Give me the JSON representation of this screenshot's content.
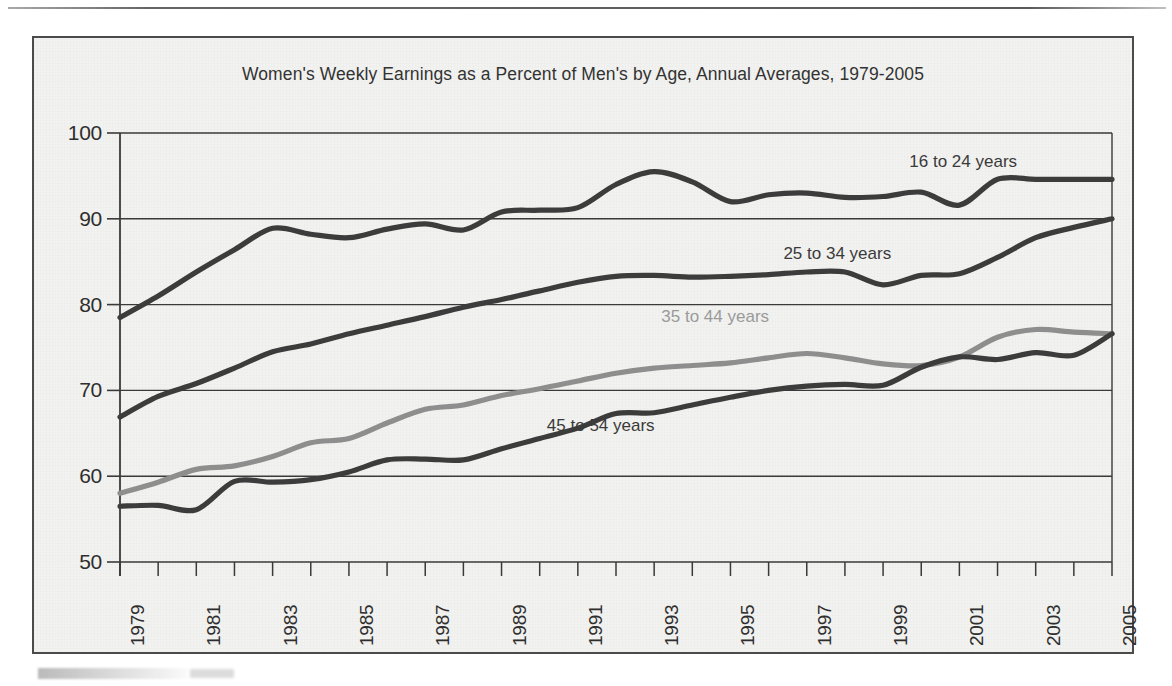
{
  "chart_data": {
    "type": "line",
    "title": "Women's Weekly Earnings as a Percent of Men's by Age, Annual Averages, 1979-2005",
    "xlabel": "",
    "ylabel": "",
    "ylim": [
      50,
      100
    ],
    "xlim": [
      1979,
      2005
    ],
    "yticks": [
      50,
      60,
      70,
      80,
      90,
      100
    ],
    "ytick_labels": [
      "50",
      "60",
      "70",
      "80",
      "90",
      "100"
    ],
    "grid": "horizontal",
    "legend_position": "inline-annotations",
    "x": [
      1979,
      1980,
      1981,
      1982,
      1983,
      1984,
      1985,
      1986,
      1987,
      1988,
      1989,
      1990,
      1991,
      1992,
      1993,
      1994,
      1995,
      1996,
      1997,
      1998,
      1999,
      2000,
      2001,
      2002,
      2003,
      2004,
      2005
    ],
    "xtick_labels": [
      "1979",
      "1981",
      "1983",
      "1985",
      "1987",
      "1989",
      "1991",
      "1993",
      "1995",
      "1997",
      "1999",
      "2001",
      "2003",
      "2005"
    ],
    "xtick_label_years": [
      1979,
      1981,
      1983,
      1985,
      1987,
      1989,
      1991,
      1993,
      1995,
      1997,
      1999,
      2001,
      2003,
      2005
    ],
    "series": [
      {
        "name": "16 to 24 years",
        "color": "#3c3c3c",
        "label_x": 2001.1,
        "label_y": 96.6,
        "values": [
          78.5,
          81.0,
          83.8,
          86.4,
          88.9,
          88.2,
          87.8,
          88.8,
          89.4,
          88.7,
          90.8,
          91.0,
          91.3,
          94.0,
          95.5,
          94.3,
          92.0,
          92.8,
          93.0,
          92.5,
          92.6,
          93.1,
          91.6,
          94.6,
          94.6,
          94.6,
          94.6
        ]
      },
      {
        "name": "25 to 34 years",
        "color": "#3c3c3c",
        "label_x": 1997.8,
        "label_y": 85.9,
        "values": [
          66.9,
          69.3,
          70.8,
          72.6,
          74.5,
          75.4,
          76.6,
          77.6,
          78.6,
          79.7,
          80.6,
          81.6,
          82.6,
          83.3,
          83.4,
          83.2,
          83.3,
          83.5,
          83.8,
          83.8,
          82.3,
          83.4,
          83.6,
          85.5,
          87.8,
          89.0,
          90.0
        ]
      },
      {
        "name": "35 to 44 years",
        "color": "#8e8e8e",
        "label_x": 1994.6,
        "label_y": 78.5,
        "values": [
          58.0,
          59.3,
          60.8,
          61.2,
          62.3,
          63.9,
          64.4,
          66.2,
          67.8,
          68.3,
          69.4,
          70.2,
          71.1,
          72.0,
          72.6,
          72.9,
          73.2,
          73.8,
          74.3,
          73.8,
          73.1,
          72.9,
          73.9,
          76.2,
          77.1,
          76.8,
          76.6
        ]
      },
      {
        "name": "45 to 54 years",
        "color": "#3c3c3c",
        "label_x": 1991.6,
        "label_y": 65.8,
        "values": [
          56.5,
          56.6,
          56.1,
          59.4,
          59.3,
          59.6,
          60.5,
          61.9,
          62.0,
          61.9,
          63.2,
          64.4,
          65.6,
          67.3,
          67.4,
          68.3,
          69.2,
          70.0,
          70.5,
          70.7,
          70.6,
          72.7,
          73.9,
          73.6,
          74.4,
          74.1,
          76.6
        ]
      }
    ]
  },
  "page": {
    "background_color": "#ffffff",
    "panel_color": "#f2f2f0",
    "axis_color": "#3a3a3a",
    "text_color": "#2e2e2e"
  }
}
